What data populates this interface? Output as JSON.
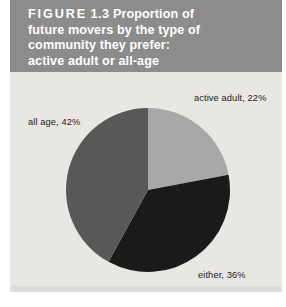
{
  "figure": {
    "label_word": "FIGURE",
    "number": "1.3",
    "caption_line1": "Proportion of",
    "caption_line2": "future movers by the type of",
    "caption_line3": "community they prefer:",
    "caption_line4": "active adult or all-age",
    "band_color": "#8c8c8c",
    "background_color": "#e9e7e3"
  },
  "chart_data": {
    "type": "pie",
    "categories": [
      "active adult",
      "either",
      "all age"
    ],
    "values": [
      22,
      36,
      42
    ],
    "value_unit": "%",
    "labels": [
      "active adult, 22%",
      "either, 36%",
      "all age, 42%"
    ],
    "colors": [
      "#a8a8a8",
      "#1a1a1a",
      "#585858"
    ],
    "start_angle_deg": 0,
    "direction": "clockwise",
    "legend": "none",
    "grid": false,
    "xlabel": "",
    "ylabel": ""
  }
}
